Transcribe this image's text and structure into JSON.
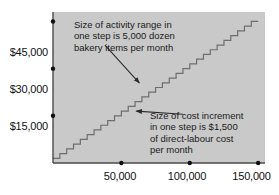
{
  "chart_data": {
    "type": "line",
    "subtype": "step",
    "title": "",
    "xlabel": "",
    "ylabel": "",
    "xlim": [
      0,
      155000
    ],
    "ylim": [
      0,
      48000
    ],
    "grid": false,
    "legend": null,
    "x_ticks": [
      50000,
      100000,
      150000
    ],
    "x_tick_labels": [
      "50,000",
      "100,000",
      "150,000"
    ],
    "y_ticks": [
      15000,
      30000,
      45000
    ],
    "y_tick_labels": [
      "$15,000",
      "$30,000",
      "$45,000"
    ],
    "step_width_units": 5000,
    "step_height_dollars": 1500,
    "step_count": 30,
    "series": [
      {
        "name": "Direct-labour cost",
        "x": [
          0,
          5000,
          10000,
          15000,
          20000,
          25000,
          30000,
          35000,
          40000,
          45000,
          50000,
          55000,
          60000,
          65000,
          70000,
          75000,
          80000,
          85000,
          90000,
          95000,
          100000,
          105000,
          110000,
          115000,
          120000,
          125000,
          130000,
          135000,
          140000,
          145000,
          150000
        ],
        "values": [
          1500,
          3000,
          4500,
          6000,
          7500,
          9000,
          10500,
          12000,
          13500,
          15000,
          16500,
          18000,
          19500,
          21000,
          22500,
          24000,
          25500,
          27000,
          28500,
          30000,
          31500,
          33000,
          34500,
          36000,
          37500,
          39000,
          40500,
          42000,
          43500,
          45000,
          45000
        ]
      }
    ],
    "annotations": [
      {
        "id": "activity-range-note",
        "text": "Size of activity range in\none step is 5,000 dozen\nbakery items per month",
        "arrow_from": [
          38000,
          37500
        ],
        "arrow_to": [
          63000,
          25500
        ]
      },
      {
        "id": "cost-increment-note",
        "text": "Size of cost increment\nin one step is $1,500\nof direct-labour cost\nper month",
        "arrow_from": [
          95000,
          15500
        ],
        "arrow_to": [
          61000,
          16500
        ]
      }
    ]
  },
  "colors": {
    "plot_background": "#c9c9c9",
    "axis": "#4a4a4a",
    "step_line": "#6e6e6e",
    "text": "#111111",
    "annotation_text": "#1a1a1a",
    "arrow": "#2b2b2b",
    "page_background": "#ffffff"
  },
  "axis_labels": {
    "y": [
      {
        "label": "$45,000",
        "value": 45000
      },
      {
        "label": "$30,000",
        "value": 30000
      },
      {
        "label": "$15,000",
        "value": 15000
      }
    ],
    "x": [
      {
        "label": "50,000",
        "value": 50000
      },
      {
        "label": "100,000",
        "value": 100000
      },
      {
        "label": "150,000",
        "value": 150000
      }
    ]
  },
  "annotations_text": {
    "activity_range": "Size of activity range in\none step is 5,000 dozen\nbakery items per month",
    "cost_increment": "Size of cost increment\nin one step is $1,500\nof direct-labour cost\nper month"
  }
}
